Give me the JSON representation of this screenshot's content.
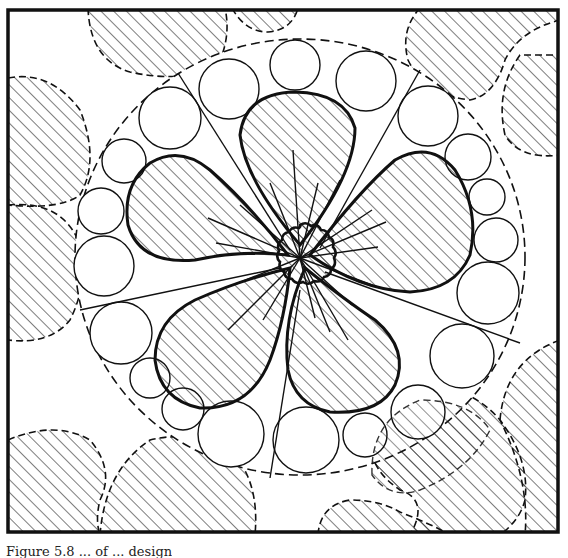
{
  "figure": {
    "kind": "decorative line-art flower design",
    "frame_color": "#111111",
    "ink_color": "#111111",
    "paper_color": "#ffffff",
    "petal_count": 5,
    "ring_circle_count": 27,
    "hatch_direction": "diagonal 45deg"
  },
  "caption": {
    "text": "Figure 5.8 ... of ... design"
  }
}
